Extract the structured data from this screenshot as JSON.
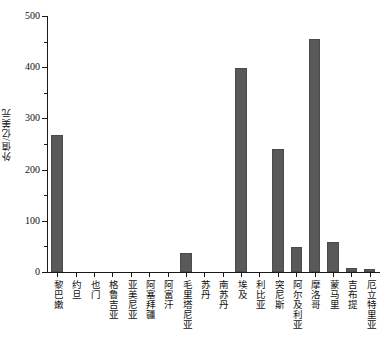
{
  "chart_data": {
    "type": "bar",
    "title": "",
    "subtitle": "",
    "xlabel": "",
    "ylabel": "外值/亿美元",
    "ylim": [
      0,
      500
    ],
    "ytick_labels": [
      "0",
      "100",
      "200",
      "300",
      "400",
      "500"
    ],
    "ytick_values": [
      0,
      100,
      200,
      300,
      400,
      500
    ],
    "yminor_values": [
      50,
      150,
      250,
      350,
      450
    ],
    "grid": false,
    "legend": null,
    "bar_color": "#595959",
    "axis_color": "#1a1a1a",
    "categories": [
      "黎巴嫩",
      "约旦",
      "也门",
      "格鲁吉亚",
      "亚美尼亚",
      "阿塞拜疆",
      "阿富汗",
      "毛里塔尼亚",
      "苏丹",
      "南苏丹",
      "埃及",
      "利比亚",
      "突尼斯",
      "阿尔及利亚",
      "摩洛哥",
      "蒙马里",
      "吉布提",
      "厄立特里亚"
    ],
    "values": [
      267,
      0,
      0,
      0,
      0,
      0,
      0,
      38,
      0,
      0,
      399,
      0,
      240,
      48,
      456,
      58,
      7,
      5
    ]
  }
}
